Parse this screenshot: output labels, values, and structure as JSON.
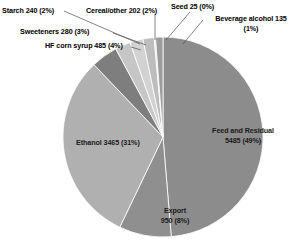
{
  "chart_data": {
    "type": "pie",
    "title": "",
    "units": "million bushels",
    "total": 11117,
    "categories": [
      "Feed and Residual",
      "Export",
      "Ethanol",
      "HF corn syrup",
      "Sweeteners",
      "Starch",
      "Cereal/other",
      "Seed",
      "Beverage alcohol"
    ],
    "values": [
      5485,
      950,
      3465,
      485,
      280,
      240,
      202,
      25,
      135
    ],
    "percents": [
      49,
      8,
      31,
      4,
      3,
      2,
      2,
      0,
      1
    ],
    "legend": "none",
    "grid": false,
    "slice_colors": [
      "#8c8c8c",
      "#8f8f8f",
      "#b0b0b0",
      "#7e7e7e",
      "#c6c6c6",
      "#d2d2d2",
      "#bdbdbd",
      "#e2e2e2",
      "#9c9c9c"
    ],
    "start_angle_deg": 0,
    "direction": "clockwise",
    "labels": [
      {
        "id": "feed",
        "name": "Feed and Residual",
        "line1": "Feed and Residual",
        "line2": "5485 (49%)",
        "text": "Feed and Residual 5485 (49%)",
        "placement": "inside"
      },
      {
        "id": "ethanol",
        "name": "Ethanol",
        "line1": "Ethanol 3465 (31%)",
        "line2": "",
        "text": "Ethanol 3465 (31%)",
        "placement": "inside"
      },
      {
        "id": "export",
        "name": "Export",
        "line1": "Export",
        "line2": "950 (8%)",
        "text": "Export 950 (8%)",
        "placement": "inside"
      },
      {
        "id": "hfcorn",
        "name": "HF corn syrup",
        "line1": "HF corn syrup 485 (4%)",
        "line2": "",
        "text": "HF corn syrup 485 (4%)",
        "placement": "outside"
      },
      {
        "id": "sweeteners",
        "name": "Sweeteners",
        "line1": "Sweeteners 280 (3%)",
        "line2": "",
        "text": "Sweeteners 280 (3%)",
        "placement": "outside"
      },
      {
        "id": "starch",
        "name": "Starch",
        "line1": "Starch 240 (2%)",
        "line2": "",
        "text": "Starch 240 (2%)",
        "placement": "outside"
      },
      {
        "id": "cereal",
        "name": "Cereal/other",
        "line1": "Cereal/other 202 (2%)",
        "line2": "",
        "text": "Cereal/other 202 (2%)",
        "placement": "outside"
      },
      {
        "id": "seed",
        "name": "Seed",
        "line1": "Seed 25 (0%)",
        "line2": "",
        "text": "Seed 25 (0%)",
        "placement": "outside"
      },
      {
        "id": "beverage",
        "name": "Beverage alcohol",
        "line1": "Beverage alcohol 135",
        "line2": "(1%)",
        "text": "Beverage alcohol 135 (1%)",
        "placement": "outside"
      }
    ]
  },
  "labels_text": {
    "starch": "Starch 240 (2%)",
    "cereal": "Cereal/other 202 (2%)",
    "seed": "Seed 25 (0%)",
    "beverage_line1": "Beverage alcohol 135",
    "beverage_line2": "(1%)",
    "sweeteners": "Sweeteners 280 (3%)",
    "hfcorn": "HF corn syrup 485 (4%)",
    "feed_line1": "Feed and Residual",
    "feed_line2": "5485 (49%)",
    "ethanol": "Ethanol 3465 (31%)",
    "export_line1": "Export",
    "export_line2": "950 (8%)"
  }
}
